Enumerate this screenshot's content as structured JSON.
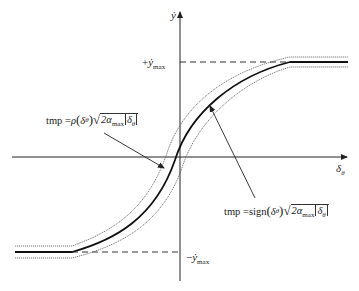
{
  "diagram": {
    "type": "saturated square-root velocity profile",
    "axes": {
      "x_label": "δ",
      "x_label_sub": "θ",
      "y_label": "ẏ"
    },
    "levels": {
      "upper_label_sign": "+",
      "upper_label": "ẏ",
      "upper_label_sub": "max",
      "lower_label_sign": "−",
      "lower_label": "ẏ",
      "lower_label_sub": "max"
    },
    "annotations": [
      {
        "lhs": "tmp = ",
        "func": "ρ",
        "arg": "δ",
        "arg_sub": "θ",
        "sqrt_coef": "2α",
        "sqrt_coef_sub": "max",
        "abs_arg": "δ",
        "abs_arg_sub": "θ",
        "points_to": "inner bound curve"
      },
      {
        "lhs": "tmp = ",
        "func": "sign",
        "arg": "δ",
        "arg_sub": "θ",
        "sqrt_coef": "2α",
        "sqrt_coef_sub": "max",
        "abs_arg": "δ",
        "abs_arg_sub": "θ",
        "points_to": "nominal curve"
      }
    ],
    "colors": {
      "curve": "#111111",
      "bounds": "#555555",
      "axis": "#222222",
      "dashed": "#333333"
    }
  }
}
